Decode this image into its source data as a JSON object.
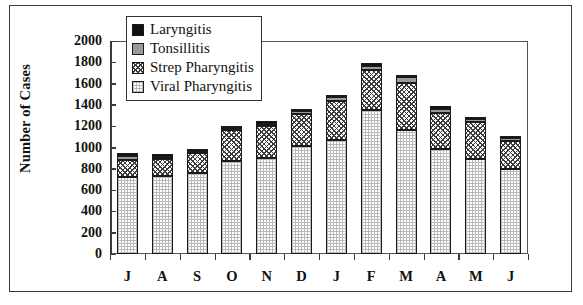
{
  "chart_data": {
    "type": "bar",
    "stacked": true,
    "title": "",
    "xlabel": "",
    "ylabel": "Number of Cases",
    "ylim": [
      0,
      2000
    ],
    "yticks": [
      0,
      200,
      400,
      600,
      800,
      1000,
      1200,
      1400,
      1600,
      1800,
      2000
    ],
    "grid": false,
    "legend_position": "top-left-inside",
    "categories": [
      "J",
      "A",
      "S",
      "O",
      "N",
      "D",
      "J",
      "F",
      "M",
      "A",
      "M",
      "J"
    ],
    "series": [
      {
        "name": "Viral Pharyngitis",
        "swatch": "light-dotted",
        "color": "#e8e8e8",
        "values": [
          720,
          730,
          760,
          870,
          900,
          1010,
          1070,
          1350,
          1160,
          990,
          890,
          800
        ]
      },
      {
        "name": "Strep Pharyngitis",
        "swatch": "dark-crosshatch",
        "color": "#6f6f6f",
        "values": [
          165,
          165,
          190,
          290,
          300,
          300,
          370,
          380,
          450,
          330,
          350,
          265
        ]
      },
      {
        "name": "Tonsillitis",
        "swatch": "solid-gray",
        "color": "#9a9a9a",
        "values": [
          35,
          15,
          20,
          20,
          20,
          30,
          30,
          35,
          50,
          40,
          25,
          25
        ]
      },
      {
        "name": "Laryngitis",
        "swatch": "solid-black",
        "color": "#111111",
        "values": [
          30,
          25,
          20,
          25,
          25,
          25,
          25,
          25,
          25,
          25,
          25,
          20
        ]
      }
    ],
    "totals": [
      950,
      935,
      990,
      1205,
      1245,
      1365,
      1495,
      1790,
      1685,
      1385,
      1290,
      1110
    ]
  },
  "legend": {
    "items": [
      {
        "label": "Laryngitis",
        "swatch": "solid-black"
      },
      {
        "label": "Tonsillitis",
        "swatch": "solid-gray"
      },
      {
        "label": "Strep Pharyngitis",
        "swatch": "dark-crosshatch"
      },
      {
        "label": "Viral Pharyngitis",
        "swatch": "light-dotted"
      }
    ]
  }
}
